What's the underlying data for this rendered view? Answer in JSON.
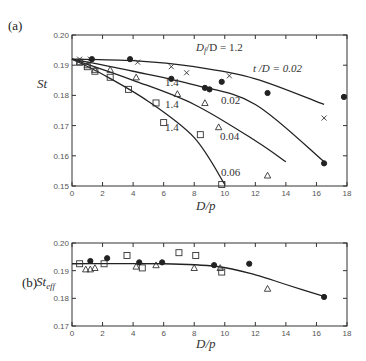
{
  "chart_data": [
    {
      "panel": "(a)",
      "type": "scatter",
      "title": "",
      "xlabel": "D/p",
      "ylabel": "St",
      "xlim": [
        0,
        18
      ],
      "ylim": [
        0.15,
        0.2
      ],
      "xticks": [
        "0",
        "2",
        "4",
        "6",
        "8",
        "10",
        "12",
        "14",
        "16",
        "18"
      ],
      "yticks": [
        "0.15",
        "0.16",
        "0.17",
        "0.18",
        "0.19",
        "0.20"
      ],
      "grid": false,
      "annotations": [
        "Df/D = 1.2",
        "t/D = 0.02",
        "1.4",
        "0.02",
        "1.4",
        "0.04",
        "1.4",
        "0.06"
      ],
      "series": [
        {
          "name": "Df/D=1.2, t/D=0.02",
          "marker": "x",
          "points": [
            [
              0.5,
              0.192
            ],
            [
              1.2,
              0.192
            ],
            [
              4.3,
              0.191
            ],
            [
              6.5,
              0.1895
            ],
            [
              7.5,
              0.1875
            ],
            [
              10.3,
              0.1865
            ],
            [
              16.5,
              0.1725
            ]
          ],
          "fit": [
            [
              0,
              0.192
            ],
            [
              4,
              0.1915
            ],
            [
              8,
              0.1895
            ],
            [
              12,
              0.1855
            ],
            [
              16.5,
              0.177
            ]
          ]
        },
        {
          "name": "Df/D=1.4, t/D=0.02",
          "marker": "filled-circle",
          "points": [
            [
              1.3,
              0.192
            ],
            [
              3.8,
              0.192
            ],
            [
              6.5,
              0.1855
            ],
            [
              8.7,
              0.1825
            ],
            [
              9.0,
              0.182
            ],
            [
              9.8,
              0.1845
            ],
            [
              12.8,
              0.1808
            ],
            [
              16.5,
              0.1575
            ],
            [
              17.8,
              0.1795
            ]
          ],
          "fit": [
            [
              0,
              0.192
            ],
            [
              4,
              0.188
            ],
            [
              8,
              0.1835
            ],
            [
              12,
              0.177
            ],
            [
              16.5,
              0.158
            ]
          ]
        },
        {
          "name": "Df/D=1.4, t/D=0.04",
          "marker": "triangle",
          "points": [
            [
              0.5,
              0.191
            ],
            [
              1.0,
              0.19
            ],
            [
              1.5,
              0.1885
            ],
            [
              2.5,
              0.1885
            ],
            [
              4.2,
              0.186
            ],
            [
              6.9,
              0.1805
            ],
            [
              8.7,
              0.1775
            ],
            [
              9.6,
              0.1695
            ],
            [
              12.8,
              0.1535
            ]
          ],
          "fit": [
            [
              0,
              0.192
            ],
            [
              4,
              0.185
            ],
            [
              8,
              0.177
            ],
            [
              12,
              0.165
            ],
            [
              14,
              0.158
            ]
          ]
        },
        {
          "name": "Df/D=1.4, t/D=0.06",
          "marker": "square",
          "points": [
            [
              0.5,
              0.191
            ],
            [
              1.0,
              0.1895
            ],
            [
              1.5,
              0.188
            ],
            [
              2.5,
              0.186
            ],
            [
              3.7,
              0.182
            ],
            [
              5.5,
              0.1775
            ],
            [
              6.0,
              0.171
            ],
            [
              8.4,
              0.167
            ],
            [
              9.8,
              0.1505
            ]
          ],
          "fit": [
            [
              0,
              0.192
            ],
            [
              2,
              0.187
            ],
            [
              5,
              0.178
            ],
            [
              8,
              0.166
            ],
            [
              10,
              0.1505
            ]
          ]
        }
      ]
    },
    {
      "panel": "(b)",
      "type": "scatter",
      "title": "",
      "xlabel": "D/p",
      "ylabel": "St_eff",
      "xlim": [
        0,
        18
      ],
      "ylim": [
        0.17,
        0.2
      ],
      "xticks": [
        "0",
        "2",
        "4",
        "6",
        "8",
        "10",
        "12",
        "14",
        "16",
        "18"
      ],
      "yticks": [
        "0.17",
        "0.18",
        "0.19",
        "0.20"
      ],
      "grid": false,
      "series": [
        {
          "name": "square",
          "marker": "square",
          "points": [
            [
              0.5,
              0.1925
            ],
            [
              2.1,
              0.1925
            ],
            [
              3.6,
              0.1955
            ],
            [
              4.6,
              0.191
            ],
            [
              7.0,
              0.1965
            ],
            [
              8.1,
              0.1955
            ],
            [
              9.8,
              0.1895
            ]
          ]
        },
        {
          "name": "triangle",
          "marker": "triangle",
          "points": [
            [
              0.9,
              0.1905
            ],
            [
              1.2,
              0.1905
            ],
            [
              1.5,
              0.191
            ],
            [
              4.2,
              0.1915
            ],
            [
              5.5,
              0.192
            ],
            [
              8.0,
              0.191
            ],
            [
              9.7,
              0.191
            ],
            [
              12.8,
              0.1835
            ]
          ]
        },
        {
          "name": "filled-circle",
          "marker": "filled-circle",
          "points": [
            [
              1.2,
              0.1935
            ],
            [
              2.3,
              0.1945
            ],
            [
              4.4,
              0.193
            ],
            [
              5.9,
              0.193
            ],
            [
              9.3,
              0.192
            ],
            [
              11.6,
              0.1925
            ],
            [
              16.5,
              0.1805
            ]
          ]
        },
        {
          "name": "fit",
          "marker": "none",
          "fit": [
            [
              0,
              0.1925
            ],
            [
              6,
              0.1925
            ],
            [
              9.5,
              0.1915
            ],
            [
              12,
              0.1885
            ],
            [
              14,
              0.185
            ],
            [
              16.6,
              0.1805
            ]
          ]
        }
      ]
    }
  ],
  "labels": {
    "panel_a": "(a)",
    "panel_b": "(b)",
    "ylabel_a": "St",
    "ylabel_b_main": "St",
    "ylabel_b_sub": "eff",
    "xlabel": "D/p",
    "ann_df12": "D",
    "ann_df12_sub": "f",
    "ann_df12_rest": "/D = 1.2",
    "ann_t002": "t /D = 0.02",
    "ann_14a": "1.4",
    "ann_002": "0.02",
    "ann_14b": "1.4",
    "ann_004": "0.04",
    "ann_14c": "1.4",
    "ann_006": "0.06"
  },
  "ticks": {
    "x": [
      "0",
      "2",
      "4",
      "6",
      "8",
      "10",
      "12",
      "14",
      "16",
      "18"
    ],
    "ya": [
      "0.15",
      "0.16",
      "0.17",
      "0.18",
      "0.19",
      "0.20"
    ],
    "yb": [
      "0.17",
      "0.18",
      "0.19",
      "0.20"
    ]
  }
}
